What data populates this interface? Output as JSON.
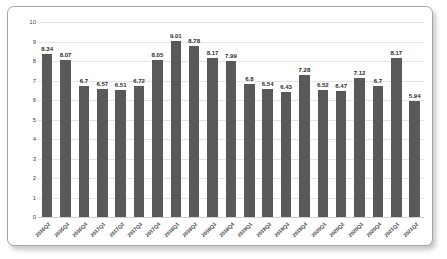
{
  "chart_data": {
    "type": "bar",
    "title": "",
    "subtitle": "",
    "xlabel": "",
    "ylabel": "",
    "ylim": [
      0,
      10
    ],
    "yticks": [
      10,
      9,
      8,
      7,
      6,
      5,
      4,
      3,
      2,
      1,
      0
    ],
    "grid": true,
    "legend": "none",
    "bar_color": "#595959",
    "plot_background": "#ffffff",
    "gridline_color": "#e4e4e4",
    "categories": [
      "2016Q2",
      "2016Q3",
      "2016Q4",
      "2017Q1",
      "2017Q2",
      "2017Q3",
      "2017Q4",
      "2018Q1",
      "2018Q2",
      "2018Q3",
      "2018Q4",
      "2019Q1",
      "2019Q2",
      "2019Q3",
      "2019Q4",
      "2020Q1",
      "2020Q2",
      "2020Q3",
      "2020Q4",
      "2021Q1",
      "2021Q2"
    ],
    "values": [
      8.34,
      8.07,
      6.7,
      6.57,
      6.51,
      6.72,
      8.05,
      9.01,
      8.78,
      8.17,
      7.99,
      6.8,
      6.54,
      6.43,
      7.28,
      6.52,
      6.47,
      7.12,
      6.7,
      8.17,
      5.94
    ],
    "data_labels": [
      "8.34",
      "8.07",
      "6.7",
      "6.57",
      "6.51",
      "6.72",
      "8.05",
      "9.01",
      "8.78",
      "8.17",
      "7.99",
      "6.8",
      "6.54",
      "6.43",
      "7.28",
      "6.52",
      "6.47",
      "7.12",
      "6.7",
      "8.17",
      "5.94"
    ]
  }
}
